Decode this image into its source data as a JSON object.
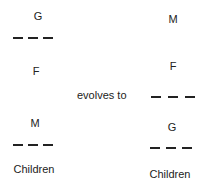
{
  "left": {
    "top_label": "G",
    "middle_label": "F",
    "lower_label": "M",
    "bottom_label": "Children"
  },
  "connector": {
    "text": "evolves to"
  },
  "right": {
    "top_label": "M",
    "middle_label": "F",
    "lower_label": "G",
    "bottom_label": "Children"
  }
}
